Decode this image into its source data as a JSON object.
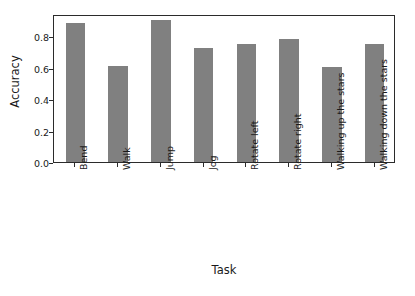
{
  "chart_data": {
    "type": "bar",
    "title": "",
    "xlabel": "Task",
    "ylabel": "Accuracy",
    "categories": [
      "Bend",
      "Walk",
      "Jump",
      "Jog",
      "Rotate left",
      "Rotate right",
      "Walking up the stars",
      "Walking down the stars"
    ],
    "values": [
      0.885,
      0.61,
      0.905,
      0.725,
      0.752,
      0.781,
      0.605,
      0.748
    ],
    "ylim": [
      0.0,
      0.94
    ],
    "yticks": [
      0.0,
      0.2,
      0.4,
      0.6,
      0.8
    ],
    "ytick_labels": [
      "0.0",
      "0.2",
      "0.4",
      "0.6",
      "0.8"
    ],
    "grid": false,
    "legend": null,
    "bar_color": "#808080",
    "axis_color": "#2b2b2b",
    "background": "#ffffff",
    "xtick_rotation": 90
  }
}
